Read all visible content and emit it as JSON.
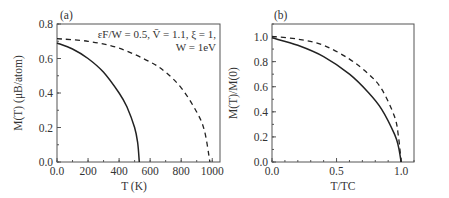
{
  "figure": {
    "panel_a": {
      "tag": "(a)",
      "ylabel": "M(T) (μB/atom)",
      "xlabel": "T (K)",
      "annotation_line1": "εF/W = 0.5, V̄ = 1.1, ξ = 1,",
      "annotation_line2": "W = 1eV",
      "xticks": [
        "0.0",
        "200",
        "400",
        "600",
        "800",
        "1000"
      ],
      "yticks": [
        "0.0",
        "0.2",
        "0.4",
        "0.6",
        "0.8"
      ]
    },
    "panel_b": {
      "tag": "(b)",
      "ylabel": "M(T)/M(0)",
      "xlabel": "T/TC",
      "xticks": [
        "0.0",
        "0.5",
        "1.0"
      ],
      "yticks": [
        "0.0",
        "0.2",
        "0.4",
        "0.6",
        "0.8",
        "1.0"
      ]
    }
  },
  "chart_data": [
    {
      "type": "line",
      "title": "(a)",
      "xlabel": "T (K)",
      "ylabel": "M(T) (μB/atom)",
      "xlim": [
        0,
        1050
      ],
      "ylim": [
        0,
        0.8
      ],
      "grid": false,
      "annotation": "εF/W = 0.5, V̄ = 1.1, ξ = 1, W = 1eV",
      "series": [
        {
          "name": "solid",
          "style": "solid",
          "x": [
            0,
            100,
            200,
            300,
            400,
            450,
            500,
            520,
            530
          ],
          "y": [
            0.69,
            0.655,
            0.6,
            0.52,
            0.4,
            0.32,
            0.2,
            0.11,
            0.0
          ]
        },
        {
          "name": "dashed",
          "style": "dashed",
          "x": [
            0,
            200,
            400,
            600,
            700,
            800,
            900,
            950,
            985
          ],
          "y": [
            0.715,
            0.7,
            0.66,
            0.58,
            0.52,
            0.43,
            0.29,
            0.18,
            0.0
          ]
        }
      ]
    },
    {
      "type": "line",
      "title": "(b)",
      "xlabel": "T/TC",
      "ylabel": "M(T)/M(0)",
      "xlim": [
        0,
        1.1
      ],
      "ylim": [
        0,
        1.1
      ],
      "grid": false,
      "series": [
        {
          "name": "solid",
          "style": "solid",
          "x": [
            0,
            0.2,
            0.4,
            0.6,
            0.75,
            0.85,
            0.95,
            0.98,
            1.0
          ],
          "y": [
            0.99,
            0.93,
            0.84,
            0.7,
            0.55,
            0.42,
            0.22,
            0.12,
            0.0
          ]
        },
        {
          "name": "dashed",
          "style": "dashed",
          "x": [
            0,
            0.2,
            0.4,
            0.6,
            0.75,
            0.85,
            0.95,
            0.98,
            1.0
          ],
          "y": [
            1.0,
            0.98,
            0.93,
            0.82,
            0.7,
            0.58,
            0.36,
            0.2,
            0.0
          ]
        }
      ]
    }
  ]
}
